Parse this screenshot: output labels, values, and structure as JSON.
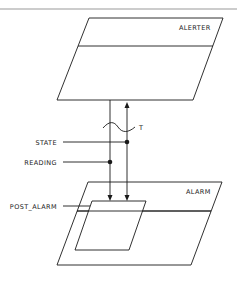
{
  "diagram": {
    "type": "structure-chart",
    "modules": {
      "alerter": {
        "label": "ALERTER"
      },
      "alarm": {
        "label": "ALARM"
      },
      "post_alarm": {
        "label": "POST_ALARM"
      }
    },
    "flows": {
      "state": {
        "label": "STATE",
        "direction": "down"
      },
      "reading": {
        "label": "READING",
        "direction": "down"
      },
      "timing": {
        "label": "T",
        "direction": "up"
      }
    },
    "colors": {
      "line": "#1a1a1a",
      "rule": "#9a9a9a",
      "background": "#ffffff"
    }
  }
}
